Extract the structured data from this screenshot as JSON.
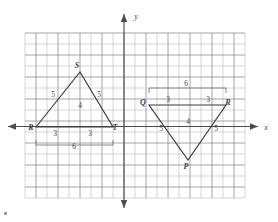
{
  "figure": {
    "axes": {
      "x_label": "x",
      "y_label": "y"
    },
    "grid": {
      "columns": 20,
      "rows": 15,
      "cell_size": 11,
      "origin_col": 9,
      "origin_row": 8.5,
      "left": 25,
      "top": 33,
      "minor_color": "#b9b9bd",
      "major_color": "#8e8e95"
    },
    "colors": {
      "axis": "#4a4a4f",
      "shape": "#3a3a3e",
      "brace": "#6d6d73",
      "text": "#3d3d42",
      "background": "#ffffff"
    },
    "triangles": [
      {
        "name": "triangle-RST",
        "vertices": [
          {
            "label": "R",
            "x": 36,
            "y": 127,
            "label_x": 31,
            "label_y": 130
          },
          {
            "label": "S",
            "x": 80,
            "y": 72,
            "label_x": 77,
            "label_y": 68
          },
          {
            "label": "T",
            "x": 113,
            "y": 127,
            "label_x": 115,
            "label_y": 130
          }
        ],
        "edge_labels": [
          {
            "text": "5",
            "x": 53,
            "y": 97
          },
          {
            "text": "5",
            "x": 99,
            "y": 97
          },
          {
            "text": "4",
            "x": 80,
            "y": 108
          },
          {
            "text": "3",
            "x": 55,
            "y": 136
          },
          {
            "text": "3",
            "x": 90,
            "y": 136
          }
        ],
        "brace": {
          "text": "6",
          "x1": 36,
          "x2": 113,
          "y": 145,
          "tick": 5,
          "label_x": 74,
          "label_y": 149
        }
      },
      {
        "name": "triangle-QRP",
        "vertices": [
          {
            "label": "Q",
            "x": 149,
            "y": 105,
            "label_x": 143,
            "label_y": 105
          },
          {
            "label": "R",
            "x": 226,
            "y": 105,
            "label_x": 228,
            "label_y": 105
          },
          {
            "label": "P",
            "x": 188,
            "y": 160,
            "label_x": 186,
            "label_y": 169
          }
        ],
        "edge_labels": [
          {
            "text": "3",
            "x": 168,
            "y": 102
          },
          {
            "text": "3",
            "x": 208,
            "y": 102
          },
          {
            "text": "5",
            "x": 161,
            "y": 131
          },
          {
            "text": "5",
            "x": 216,
            "y": 131
          },
          {
            "text": "4",
            "x": 188,
            "y": 124
          }
        ],
        "brace": {
          "text": "6",
          "x1": 149,
          "x2": 226,
          "y": 88,
          "tick": -5,
          "label_x": 186,
          "label_y": 86
        }
      }
    ]
  }
}
